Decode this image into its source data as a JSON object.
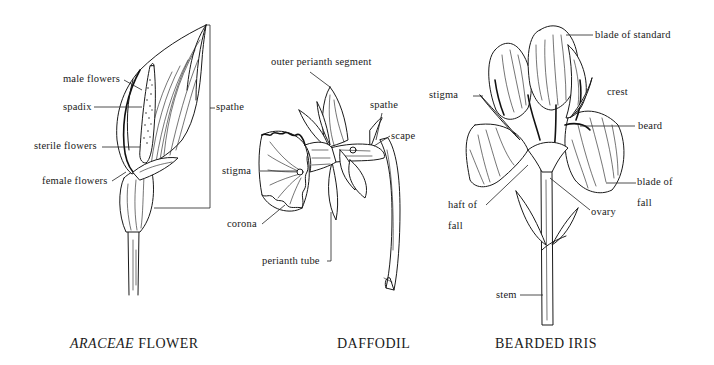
{
  "figures": [
    {
      "id": "araceae",
      "title_italic": "ARACEAE",
      "title_rest": " FLOWER",
      "labels": {
        "male_flowers": "male flowers",
        "spadix": "spadix",
        "sterile_flowers": "sterile flowers",
        "female_flowers": "female flowers",
        "spathe": "spathe"
      }
    },
    {
      "id": "daffodil",
      "title": "DAFFODIL",
      "labels": {
        "outer_perianth_segment": "outer perianth segment",
        "spathe": "spathe",
        "scape": "scape",
        "stigma": "stigma",
        "corona": "corona",
        "perianth_tube": "perianth tube"
      }
    },
    {
      "id": "bearded_iris",
      "title": "BEARDED IRIS",
      "labels": {
        "blade_of_standard": "blade of standard",
        "stigma": "stigma",
        "crest": "crest",
        "beard": "beard",
        "blade_of_fall_1": "blade of",
        "blade_of_fall_2": "fall",
        "haft_of_fall_1": "haft of",
        "haft_of_fall_2": "fall",
        "ovary": "ovary",
        "stem": "stem"
      }
    }
  ]
}
